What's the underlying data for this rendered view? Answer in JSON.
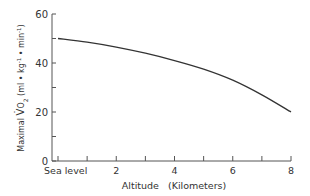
{
  "chart_data": {
    "type": "line",
    "title": "",
    "xlabel": "Altitude   (Kilometers)",
    "ylabel": "Maximal V̇O₂ (ml • kg⁻¹ • min⁻¹)",
    "ylabel_parts": {
      "prefix": "Maximal ",
      "v": "V",
      "sub": "2",
      "units": " (ml • kg",
      "exp1": "-1",
      "mid": " • min",
      "exp2": "-1",
      "close": ")"
    },
    "xlim": [
      0,
      8
    ],
    "ylim": [
      0,
      60
    ],
    "x_ticks": [
      0,
      1,
      2,
      3,
      4,
      5,
      6,
      7,
      8
    ],
    "x_tick_labels": [
      {
        "x": 0,
        "label": "Sea level"
      },
      {
        "x": 2,
        "label": "2"
      },
      {
        "x": 4,
        "label": "4"
      },
      {
        "x": 6,
        "label": "6"
      },
      {
        "x": 8,
        "label": "8"
      }
    ],
    "y_ticks": [
      0,
      10,
      20,
      30,
      40,
      50,
      60
    ],
    "y_tick_labels": [
      {
        "y": 0,
        "label": "0"
      },
      {
        "y": 20,
        "label": "20"
      },
      {
        "y": 40,
        "label": "40"
      },
      {
        "y": 60,
        "label": "60"
      }
    ],
    "grid": false,
    "legend": null,
    "series": [
      {
        "name": "Maximal VO2",
        "x": [
          0,
          1,
          2,
          3,
          4,
          5,
          6,
          7,
          8
        ],
        "values": [
          50,
          48.5,
          46.5,
          44,
          41,
          37.5,
          33,
          27,
          20
        ]
      }
    ],
    "colors": {
      "line": "#333333",
      "axis": "#555555"
    }
  }
}
